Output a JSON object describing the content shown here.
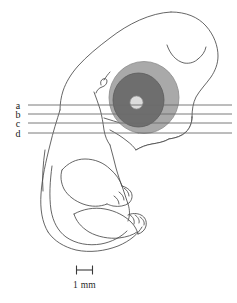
{
  "figure": {
    "type": "anatomical-line-drawing",
    "background_color": "#ffffff",
    "outline_color": "#4a4a4a"
  },
  "section_lines": {
    "label_a": "a",
    "label_b": "b",
    "label_c": "c",
    "label_d": "d",
    "line_color": "#6b6b6b",
    "lines": [
      {
        "id": "a",
        "label": "a",
        "y": 105,
        "x_start": 28,
        "x_end": 232
      },
      {
        "id": "b",
        "label": "b",
        "y": 114,
        "x_start": 28,
        "x_end": 232
      },
      {
        "id": "c",
        "label": "c",
        "y": 123,
        "x_start": 28,
        "x_end": 232
      },
      {
        "id": "d",
        "label": "d",
        "y": 133,
        "x_start": 28,
        "x_end": 232
      }
    ]
  },
  "eye": {
    "outer_ring_color": "#a9a9a9",
    "inner_ring_color": "#6e6e6e",
    "lens_color": "#dcdcdc",
    "outline_color": "#7a7a7a"
  },
  "scale_bar": {
    "label": "1 mm",
    "bar_color": "#3a3a3a",
    "x_start": 76,
    "x_end": 93,
    "y": 270,
    "tick_height": 9
  }
}
